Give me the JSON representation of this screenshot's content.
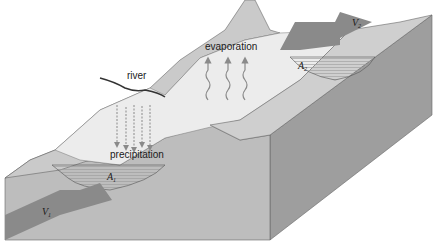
{
  "diagram": {
    "type": "block diagram of a river channel water balance",
    "labels": {
      "river": "river",
      "evaporation": "evaporation",
      "precipitation": "precipitation",
      "a1": "A",
      "a1_sub": "1",
      "a2": "A",
      "a2_sub": "2",
      "v1": "V",
      "v1_sub": "1",
      "v2": "V",
      "v2_sub": "2"
    },
    "colors": {
      "background": "#ffffff",
      "land_top": "#c9c9c9",
      "front_face": "#b9b9b9",
      "side_face": "#9e9e9e",
      "floodplain": "#ececec",
      "water": "#f4f4f4",
      "arrow": "#8a8a8a",
      "outline": "#555555"
    }
  }
}
